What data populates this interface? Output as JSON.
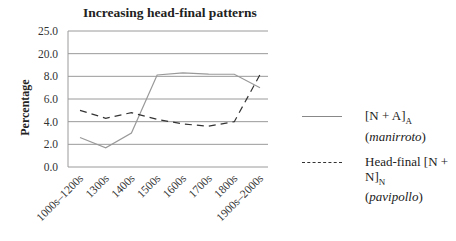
{
  "chart_data": {
    "type": "line",
    "title": "Increasing head-final patterns",
    "xlabel": "",
    "ylabel": "Percentage",
    "ytick_labels": [
      "0.0",
      "2.0",
      "4.0",
      "6.0",
      "8.0",
      "20.0",
      "25.0"
    ],
    "ylim": [
      0,
      25
    ],
    "grid": true,
    "legend_position": "right",
    "categories": [
      "1000s–1200s",
      "1300s",
      "1400s",
      "1500s",
      "1600s",
      "1700s",
      "1800s",
      "1900s–2000s"
    ],
    "series": [
      {
        "name": "[N + A]A (manirroto)",
        "style": "solid",
        "color": "#999999",
        "values": [
          2.6,
          1.7,
          3.0,
          12.0,
          19.5,
          16.0,
          15.5,
          6.8
        ],
        "tick_positions": [
          2.6,
          1.7,
          3.0,
          8.7,
          9.8,
          9.2,
          9.1,
          7.0
        ]
      },
      {
        "name": "Head-final [N + N]N (pavipollo)",
        "style": "dashed",
        "color": "#333333",
        "values": [
          5.0,
          4.3,
          4.8,
          4.2,
          3.8,
          3.6,
          4.0,
          18.0
        ],
        "tick_positions": [
          5.0,
          4.3,
          4.8,
          4.2,
          3.8,
          3.6,
          4.0,
          8.9
        ]
      }
    ]
  },
  "legend": {
    "item1": {
      "main": "[N + A]",
      "sub": "A",
      "note": "manirroto"
    },
    "item2": {
      "main": "Head-final [N + N]",
      "sub": "N",
      "note": "pavipollo"
    }
  }
}
